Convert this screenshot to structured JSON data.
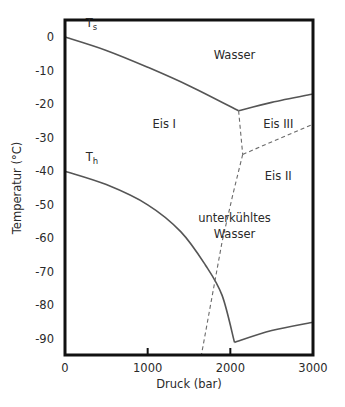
{
  "chart_data": {
    "type": "line",
    "title": "",
    "xlabel": "Druck (bar)",
    "ylabel": "Temperatur (°C)",
    "xlim": [
      0,
      3000
    ],
    "ylim": [
      -95,
      5
    ],
    "grid": false,
    "legend": "none",
    "x_ticks": [
      0,
      1000,
      2000,
      3000
    ],
    "x_tick_labels": [
      "0",
      "1000",
      "2000",
      "3000"
    ],
    "y_ticks": [
      0,
      -10,
      -20,
      -30,
      -40,
      -50,
      -60,
      -70,
      -80,
      -90
    ],
    "y_tick_labels": [
      "0",
      "-10",
      "-20",
      "-30",
      "-40",
      "-50",
      "-60",
      "-70",
      "-80",
      "-90"
    ],
    "series": [
      {
        "name": "T_s (Schmelzkurve Eis I)",
        "style": "solid",
        "points": [
          [
            0,
            0
          ],
          [
            500,
            -4
          ],
          [
            1000,
            -9
          ],
          [
            1500,
            -14.5
          ],
          [
            2100,
            -22
          ]
        ]
      },
      {
        "name": "Wasser / Eis III",
        "style": "solid",
        "points": [
          [
            2100,
            -22
          ],
          [
            2500,
            -19.5
          ],
          [
            3000,
            -17
          ]
        ]
      },
      {
        "name": "T_h (homogene Nukleation)",
        "style": "solid",
        "points": [
          [
            0,
            -40
          ],
          [
            500,
            -44
          ],
          [
            1000,
            -50
          ],
          [
            1400,
            -58
          ],
          [
            1700,
            -68
          ],
          [
            1900,
            -77
          ],
          [
            2050,
            -91
          ]
        ]
      },
      {
        "name": "T_h (Eis III)",
        "style": "solid",
        "points": [
          [
            2050,
            -91
          ],
          [
            2500,
            -87.5
          ],
          [
            3000,
            -85
          ]
        ]
      },
      {
        "name": "Eis I / Eis III",
        "style": "dashed",
        "points": [
          [
            2100,
            -22
          ],
          [
            2150,
            -35
          ]
        ]
      },
      {
        "name": "Eis III / Eis II",
        "style": "dashed",
        "points": [
          [
            2150,
            -35
          ],
          [
            3000,
            -26
          ]
        ]
      },
      {
        "name": "Eis I / Eis II",
        "style": "dashed",
        "points": [
          [
            2150,
            -35
          ],
          [
            2030,
            -47
          ],
          [
            1900,
            -61
          ],
          [
            1650,
            -95
          ]
        ]
      }
    ],
    "annotations": [
      {
        "text": "T",
        "sub": "s",
        "x": 250,
        "y": 3
      },
      {
        "text": "T",
        "sub": "h",
        "x": 250,
        "y": -37
      },
      {
        "text": "Wasser",
        "x": 2050,
        "y": -6.5
      },
      {
        "text": "Eis I",
        "x": 1200,
        "y": -27
      },
      {
        "text": "Eis III",
        "x": 2580,
        "y": -27
      },
      {
        "text": "Eis II",
        "x": 2580,
        "y": -42.5
      },
      {
        "text": "unterkühltes",
        "x": 2050,
        "y": -55
      },
      {
        "text": "Wasser",
        "x": 2050,
        "y": -60
      }
    ]
  }
}
